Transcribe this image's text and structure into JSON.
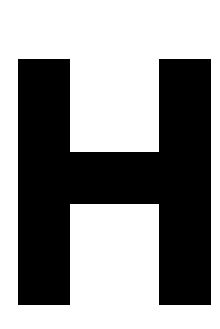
{
  "image": {
    "kind": "glyph-render",
    "character": "H",
    "character_name": "latin-capital-letter-h",
    "description": "Large black sans-serif capital letter H centered on a plain white background",
    "width": 220,
    "height": 329
  },
  "colors": {
    "background": "#ffffff",
    "glyph": "#000000"
  },
  "glyph": {
    "label": "H",
    "strokes": [
      {
        "name": "left-stem",
        "left": 18,
        "top": 59,
        "width": 52,
        "height": 246
      },
      {
        "name": "right-stem",
        "left": 159,
        "top": 59,
        "width": 52,
        "height": 246
      },
      {
        "name": "crossbar",
        "left": 18,
        "top": 152,
        "width": 193,
        "height": 52
      }
    ],
    "metrics": {
      "cap_top": 59,
      "baseline": 305,
      "cap_height": 246,
      "stem_width": 52,
      "crossbar_thickness": 52,
      "counter_width": 89,
      "advance_left": 18,
      "advance_right": 210
    }
  }
}
